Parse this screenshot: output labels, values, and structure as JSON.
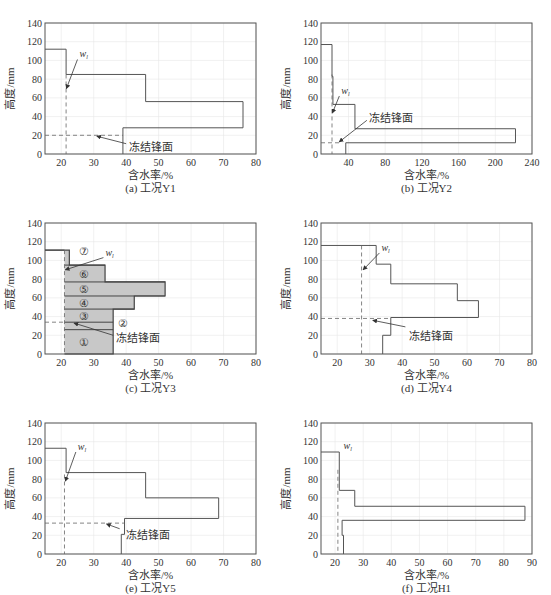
{
  "chart_data": [
    {
      "type": "line",
      "id": "a",
      "caption": "(a) 工况Y1",
      "xlabel": "含水率/%",
      "ylabel": "高度/mm",
      "xlim": [
        15,
        80
      ],
      "xticks": [
        20,
        30,
        40,
        50,
        60,
        70,
        80
      ],
      "ylim": [
        0,
        140
      ],
      "yticks": [
        0,
        20,
        40,
        60,
        80,
        100,
        120,
        140
      ],
      "grid": true,
      "profile": [
        [
          15,
          112
        ],
        [
          21.5,
          112
        ],
        [
          21.5,
          85
        ],
        [
          46,
          85
        ],
        [
          46,
          56
        ],
        [
          76,
          56
        ],
        [
          76,
          28
        ],
        [
          39,
          28
        ],
        [
          39,
          0
        ]
      ],
      "wl": 21.5,
      "wl_label": "w",
      "wl_arrow": {
        "from": [
          25,
          101
        ],
        "to": [
          21.6,
          70
        ]
      },
      "frost_front": 20,
      "frost_label": "冻结锋面",
      "frost_arrow": {
        "from": [
          40,
          11
        ],
        "to": [
          31,
          19
        ]
      },
      "frost_text_pos": [
        41,
        8
      ]
    },
    {
      "type": "line",
      "id": "b",
      "caption": "(b) 工况Y2",
      "xlabel": "含水率/%",
      "ylabel": "高度/mm",
      "xlim": [
        10,
        240
      ],
      "xticks": [
        40,
        80,
        120,
        160,
        200,
        240
      ],
      "ylim": [
        0,
        140
      ],
      "yticks": [
        0,
        20,
        40,
        60,
        80,
        100,
        120,
        140
      ],
      "grid": true,
      "profile": [
        [
          10,
          117
        ],
        [
          22,
          117
        ],
        [
          22,
          83
        ],
        [
          23,
          83
        ],
        [
          23,
          53
        ],
        [
          47,
          53
        ],
        [
          47,
          27
        ],
        [
          222,
          27
        ],
        [
          222,
          12
        ],
        [
          37,
          12
        ],
        [
          37,
          0
        ]
      ],
      "wl": 22,
      "wl_label": "w",
      "wl_arrow": {
        "from": [
          30,
          62
        ],
        "to": [
          22.5,
          44
        ]
      },
      "frost_front": 12,
      "frost_label": "冻结锋面",
      "frost_arrow": {
        "from": [
          60,
          36
        ],
        "to": [
          30,
          13
        ]
      },
      "frost_text_pos": [
        62,
        38
      ]
    },
    {
      "type": "area",
      "id": "c",
      "caption": "(c) 工况Y3",
      "xlabel": "含水率/%",
      "ylabel": "高度/mm",
      "xlim": [
        15,
        80
      ],
      "xticks": [
        20,
        30,
        40,
        50,
        60,
        70,
        80
      ],
      "ylim": [
        0,
        140
      ],
      "yticks": [
        0,
        20,
        40,
        60,
        80,
        100,
        120,
        140
      ],
      "grid": true,
      "profile": [
        [
          15,
          111
        ],
        [
          22.5,
          111
        ],
        [
          22.5,
          95
        ],
        [
          33.5,
          95
        ],
        [
          33.5,
          77
        ],
        [
          52,
          77
        ],
        [
          52,
          62
        ],
        [
          42.5,
          62
        ],
        [
          42.5,
          48
        ],
        [
          36,
          48
        ],
        [
          36,
          0
        ],
        [
          21,
          0
        ]
      ],
      "layers": [
        {
          "label": "①",
          "x": 27,
          "y": 13
        },
        {
          "label": "②",
          "x": 39,
          "y": 33
        },
        {
          "label": "③",
          "x": 27,
          "y": 41
        },
        {
          "label": "④",
          "x": 27,
          "y": 55
        },
        {
          "label": "⑤",
          "x": 27,
          "y": 69
        },
        {
          "label": "⑥",
          "x": 27,
          "y": 86
        },
        {
          "label": "⑦",
          "x": 27,
          "y": 110
        }
      ],
      "layer_boundaries": [
        26,
        34,
        48,
        62,
        77,
        95
      ],
      "wl": 21,
      "wl_label": "w",
      "wl_arrow": {
        "from": [
          33,
          103
        ],
        "to": [
          21.3,
          90
        ]
      },
      "frost_front": 34,
      "frost_label": "冻结锋面",
      "frost_arrow": {
        "from": [
          36,
          20
        ],
        "to": [
          24,
          33
        ]
      },
      "frost_text_pos": [
        37,
        17
      ]
    },
    {
      "type": "line",
      "id": "d",
      "caption": "(d) 工况Y4",
      "xlabel": "含水率/%",
      "ylabel": "高度/mm",
      "xlim": [
        15,
        80
      ],
      "xticks": [
        20,
        30,
        40,
        50,
        60,
        70,
        80
      ],
      "ylim": [
        0,
        140
      ],
      "yticks": [
        0,
        20,
        40,
        60,
        80,
        100,
        120,
        140
      ],
      "grid": true,
      "profile": [
        [
          15,
          116
        ],
        [
          32,
          116
        ],
        [
          32,
          96
        ],
        [
          36.5,
          96
        ],
        [
          36.5,
          75
        ],
        [
          57,
          75
        ],
        [
          57,
          57
        ],
        [
          63.5,
          57
        ],
        [
          63.5,
          39
        ],
        [
          36.5,
          39
        ],
        [
          36.5,
          20
        ],
        [
          34,
          20
        ],
        [
          34,
          0
        ]
      ],
      "wl": 27.5,
      "wl_label": "w",
      "wl_arrow": {
        "from": [
          33,
          108
        ],
        "to": [
          28,
          90
        ]
      },
      "frost_front": 38,
      "frost_label": "冻结锋面",
      "frost_arrow": {
        "from": [
          41,
          29
        ],
        "to": [
          31,
          36
        ]
      },
      "frost_text_pos": [
        42,
        19
      ]
    },
    {
      "type": "line",
      "id": "e",
      "caption": "(e) 工况Y5",
      "xlabel": "含水率/%",
      "ylabel": "高度/mm",
      "xlim": [
        15,
        80
      ],
      "xticks": [
        20,
        30,
        40,
        50,
        60,
        70,
        80
      ],
      "ylim": [
        0,
        140
      ],
      "yticks": [
        0,
        20,
        40,
        60,
        80,
        100,
        120,
        140
      ],
      "grid": true,
      "profile": [
        [
          15,
          113
        ],
        [
          21.5,
          113
        ],
        [
          21.5,
          87
        ],
        [
          46,
          87
        ],
        [
          46,
          60
        ],
        [
          68.5,
          60
        ],
        [
          68.5,
          38
        ],
        [
          39.5,
          38
        ],
        [
          39.5,
          21
        ],
        [
          38.5,
          21
        ],
        [
          38.5,
          0
        ]
      ],
      "wl": 21,
      "wl_label": "w",
      "wl_arrow": {
        "from": [
          24.5,
          109
        ],
        "to": [
          21.3,
          78
        ]
      },
      "frost_front": 33,
      "frost_label": "冻结锋面",
      "frost_arrow": {
        "from": [
          38,
          27
        ],
        "to": [
          34,
          32
        ]
      },
      "frost_text_pos": [
        40,
        20
      ]
    },
    {
      "type": "line",
      "id": "f",
      "caption": "(f) 工况H1",
      "xlabel": "含水率/%",
      "ylabel": "高度/mm",
      "xlim": [
        15,
        90
      ],
      "xticks": [
        20,
        30,
        40,
        50,
        60,
        70,
        80,
        90
      ],
      "ylim": [
        0,
        140
      ],
      "yticks": [
        0,
        20,
        40,
        60,
        80,
        100,
        120,
        140
      ],
      "grid": true,
      "profile": [
        [
          15,
          109
        ],
        [
          21.5,
          109
        ],
        [
          21.5,
          68
        ],
        [
          27,
          68
        ],
        [
          27,
          51
        ],
        [
          87.5,
          51
        ],
        [
          87.5,
          36
        ],
        [
          22.5,
          36
        ],
        [
          22.5,
          20
        ],
        [
          23,
          20
        ],
        [
          23,
          0
        ]
      ],
      "wl": 21,
      "wl_label": "w",
      "wl_arrow": null,
      "wl_text_pos": [
        23,
        112
      ],
      "frost_front": null,
      "frost_label": null
    }
  ]
}
